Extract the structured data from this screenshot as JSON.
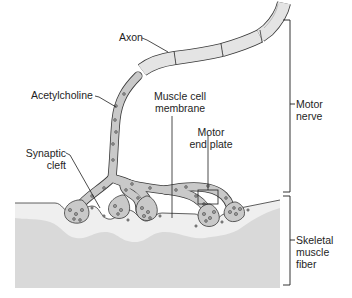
{
  "diagram": {
    "labels": {
      "axon": "Axon",
      "acetylcholine": "Acetylcholine",
      "muscle_cell_membrane_line1": "Muscle cell",
      "muscle_cell_membrane_line2": "membrane",
      "motor_end_plate_line1": "Motor",
      "motor_end_plate_line2": "end plate",
      "synaptic_cleft_line1": "Synaptic",
      "synaptic_cleft_line2": "cleft",
      "motor_nerve_line1": "Motor",
      "motor_nerve_line2": "nerve",
      "skeletal_muscle_fiber_line1": "Skeletal",
      "skeletal_muscle_fiber_line2": "muscle",
      "skeletal_muscle_fiber_line3": "fiber"
    },
    "colors": {
      "muscle_fiber": "#d9d9d9",
      "muscle_membrane_band": "#efefef",
      "axon_fill": "#c9c9c9",
      "myelin_fill": "#e4e4e4",
      "outline": "#3a3a3a",
      "vesicle": "#9a9a9a",
      "text": "#1e1e1e"
    }
  }
}
